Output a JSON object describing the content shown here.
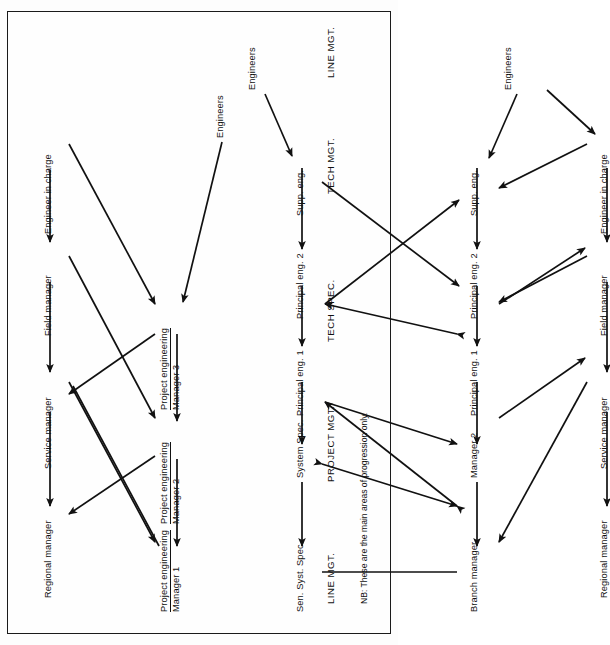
{
  "figure": {
    "note": "NB:  These are the main areas of progression only.",
    "ink_color": "#111111",
    "page_bg": "#fefefe"
  },
  "column_headers": [
    {
      "id": "line-mgt-top",
      "label": "LINE MGT."
    },
    {
      "id": "project-mgt",
      "label": "PROJECT MGT."
    },
    {
      "id": "tech-spec",
      "label": "TECH SPEC."
    },
    {
      "id": "tech-mgt",
      "label": "TECH MGT."
    },
    {
      "id": "line-mgt-bottom",
      "label": "LINE MGT."
    }
  ],
  "nodes": [
    {
      "id": "n-regional-1",
      "line1": "Regional manager",
      "line2": "",
      "underline": false
    },
    {
      "id": "n-service-1",
      "line1": "Service manager",
      "line2": "",
      "underline": false
    },
    {
      "id": "n-field-1",
      "line1": "Field manager",
      "line2": "",
      "underline": false
    },
    {
      "id": "n-eic-1",
      "line1": "Engineer in charge",
      "line2": "",
      "underline": false
    },
    {
      "id": "n-pem1",
      "line1": "Project engineering",
      "line2": "Manager 1",
      "underline": true
    },
    {
      "id": "n-pem2",
      "line1": "Project engineering",
      "line2": "Manager 2",
      "underline": true
    },
    {
      "id": "n-pem3",
      "line1": "Project engineering",
      "line2": "Manager 3",
      "underline": true
    },
    {
      "id": "n-engineers-p",
      "line1": "Engineers",
      "line2": "",
      "underline": false
    },
    {
      "id": "n-sensyst",
      "line1": "Sen. Syst. Spec.",
      "line2": "",
      "underline": false
    },
    {
      "id": "n-sysspec",
      "line1": "System Spec.",
      "line2": "",
      "underline": false
    },
    {
      "id": "n-prineng1-ts",
      "line1": "Principal eng. 1",
      "line2": "",
      "underline": false
    },
    {
      "id": "n-prineng2-ts",
      "line1": "Principal eng. 2",
      "line2": "",
      "underline": false
    },
    {
      "id": "n-suppeng-ts",
      "line1": "Supp. eng.",
      "line2": "",
      "underline": false
    },
    {
      "id": "n-engineers-t",
      "line1": "Engineers",
      "line2": "",
      "underline": false
    },
    {
      "id": "n-branch",
      "line1": "Branch manager",
      "line2": "",
      "underline": false
    },
    {
      "id": "n-manager2",
      "line1": "Manager 2",
      "line2": "",
      "underline": false
    },
    {
      "id": "n-prineng1-tm",
      "line1": "Principal eng. 1",
      "line2": "",
      "underline": false
    },
    {
      "id": "n-prineng2-tm",
      "line1": "Principal eng. 2",
      "line2": "",
      "underline": false
    },
    {
      "id": "n-suppeng-tm",
      "line1": "Supp. eng.",
      "line2": "",
      "underline": false
    },
    {
      "id": "n-engineers-b",
      "line1": "Engineers",
      "line2": "",
      "underline": false
    },
    {
      "id": "n-regional-2",
      "line1": "Regional manager",
      "line2": "",
      "underline": false
    },
    {
      "id": "n-service-2",
      "line1": "Service manager",
      "line2": "",
      "underline": false
    },
    {
      "id": "n-field-2",
      "line1": "Field manager",
      "line2": "",
      "underline": false
    },
    {
      "id": "n-eic-2",
      "line1": "Engineer in charge",
      "line2": "",
      "underline": false
    }
  ],
  "edges_description": [
    "Engineer in charge -> Field manager -> Service manager -> Regional manager (line mgt, top row)",
    "Project engineering Manager 3 -> Manager 2 -> Manager 1 (project mgt row)",
    "Cross links between line mgt row and project engineering managers (both directions)",
    "Engineers -> Project engineering Manager 3",
    "Supp. eng. -> Principal eng. 2 -> Principal eng. 1 -> System Spec. -> Sen. Syst. Spec. (tech spec row)",
    "Engineers -> Supp. eng.",
    "Supp. eng. -> Principal eng. 2 -> Principal eng. 1 -> Manager 2 -> Branch manager (tech mgt row)",
    "Branch manager — Sen. Syst. Spec. (plain link, no arrowhead)",
    "Crossing double-headed links between tech spec row and tech mgt row",
    "Engineer in charge -> Field manager -> Service manager -> Regional manager (line mgt, bottom row)",
    "Engineers <-> Engineer in charge, Engineers -> Supp. eng.",
    "Crossing double-headed links between tech mgt row and line mgt bottom row"
  ]
}
